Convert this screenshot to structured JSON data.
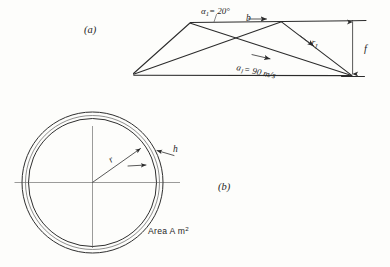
{
  "figure": {
    "panel_a": {
      "caption": "(a)",
      "labels": {
        "alpha_symbol": "α",
        "alpha_sub": "1",
        "alpha_value": "= 20°",
        "blade_symbol": "b",
        "velocity_symbol": "a",
        "velocity_sub": "1",
        "velocity_value": "= 90 m/s",
        "relative_symbol": "r",
        "relative_sub": "1",
        "dimension_symbol": "f"
      }
    },
    "panel_b": {
      "caption": "(b)",
      "labels": {
        "radius_symbol": "r",
        "thickness_symbol": "h",
        "area_text": "Area A m",
        "area_exponent": "2"
      }
    },
    "colors": {
      "ink": "#2b2b2b",
      "ink_light": "#6a6a6a",
      "paper": "#fdfdfb"
    }
  }
}
